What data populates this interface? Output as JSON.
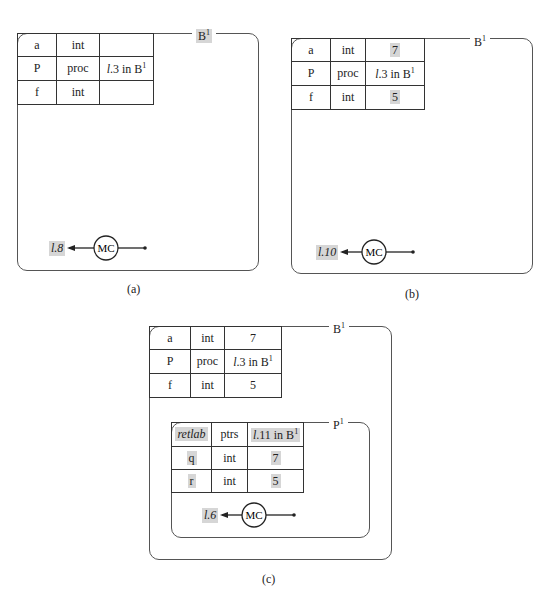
{
  "panels": [
    {
      "id": "a",
      "caption": "(a)",
      "frame_label": "B",
      "frame_sup": "1",
      "frame_label_highlighted": true,
      "rows": [
        {
          "name": "a",
          "type": "int",
          "value": "",
          "value_hl": false
        },
        {
          "name": "P",
          "type": "proc",
          "value": "l.3 in B",
          "value_sup": "1",
          "value_hl": false
        },
        {
          "name": "f",
          "type": "int",
          "value": "",
          "value_hl": false
        }
      ],
      "mc_label": "MC",
      "return_label": "l.8"
    },
    {
      "id": "b",
      "caption": "(b)",
      "frame_label": "B",
      "frame_sup": "1",
      "frame_label_highlighted": false,
      "rows": [
        {
          "name": "a",
          "type": "int",
          "value": "7",
          "value_hl": true
        },
        {
          "name": "P",
          "type": "proc",
          "value": "l.3 in B",
          "value_sup": "1",
          "value_hl": false
        },
        {
          "name": "f",
          "type": "int",
          "value": "5",
          "value_hl": true
        }
      ],
      "mc_label": "MC",
      "return_label": "l.10"
    },
    {
      "id": "c",
      "caption": "(c)",
      "frame_label": "B",
      "frame_sup": "1",
      "frame_label_highlighted": false,
      "rows": [
        {
          "name": "a",
          "type": "int",
          "value": "7",
          "value_hl": false
        },
        {
          "name": "P",
          "type": "proc",
          "value": "l.3 in B",
          "value_sup": "1",
          "value_hl": false
        },
        {
          "name": "f",
          "type": "int",
          "value": "5",
          "value_hl": false
        }
      ],
      "inner": {
        "frame_label": "P",
        "frame_sup": "1",
        "rows": [
          {
            "name": "retlab",
            "type": "ptrs",
            "value": "l.11 in B",
            "value_sup": "1",
            "name_hl": true,
            "value_hl": true
          },
          {
            "name": "q",
            "type": "int",
            "value": "7",
            "name_hl": true,
            "value_hl": true
          },
          {
            "name": "r",
            "type": "int",
            "value": "5",
            "name_hl": true,
            "value_hl": true
          }
        ],
        "mc_label": "MC",
        "return_label": "l.6"
      }
    }
  ]
}
